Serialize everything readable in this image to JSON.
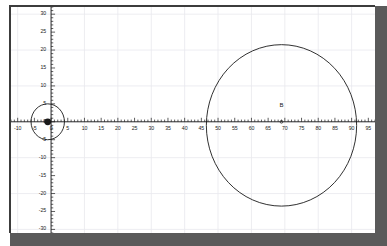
{
  "figure": {
    "background": "#ffffff",
    "frame_color": "#5a5a5a",
    "axis_color": "#1a1a1a",
    "grid_color": "#e9e9ee",
    "curve_color": "#1a1a1a"
  },
  "chart_data": {
    "type": "scatter",
    "title": "",
    "subtitle": "",
    "xlabel": "",
    "ylabel": "",
    "xlim": [
      -12,
      97
    ],
    "ylim": [
      -31,
      32
    ],
    "grid": true,
    "grid_step_x": 10,
    "grid_step_y": 10,
    "legend": "none",
    "x_major_step": 5,
    "x_minor_step": 1,
    "y_major_step": 5,
    "y_minor_step": 1,
    "x_ticks": [
      -10,
      -5,
      0,
      5,
      10,
      15,
      20,
      25,
      30,
      35,
      40,
      45,
      50,
      55,
      60,
      65,
      70,
      75,
      80,
      85,
      90,
      95
    ],
    "x_tick_labels": [
      "-10",
      "-5",
      "0",
      "5",
      "10",
      "15",
      "20",
      "25",
      "30",
      "35",
      "40",
      "45",
      "50",
      "55",
      "60",
      "65",
      "70",
      "75",
      "80",
      "85",
      "90",
      "95"
    ],
    "y_ticks": [
      30,
      25,
      20,
      15,
      10,
      5,
      0,
      -5,
      -10,
      -15,
      -20,
      -25,
      -30
    ],
    "y_tick_labels": [
      "30",
      "25",
      "20",
      "15",
      "10",
      "5",
      "0",
      "-5",
      "-10",
      "-15",
      "-20",
      "-25",
      "-30"
    ],
    "shapes": [
      {
        "kind": "circle",
        "name": "small-circle",
        "cx": -1,
        "cy": 0,
        "r": 5,
        "stroke": "#1a1a1a",
        "fill": "none"
      },
      {
        "kind": "circle",
        "name": "large-circle",
        "cx": 69,
        "cy": -1,
        "r": 22.5,
        "stroke": "#1a1a1a",
        "fill": "none"
      }
    ],
    "points": [
      {
        "name": "point-a",
        "label": "",
        "x": -1,
        "y": 0,
        "marker": "filled-dot",
        "size": 3.4
      },
      {
        "name": "point-b",
        "label": "B",
        "x": 69,
        "y": 0,
        "marker": "tick",
        "size": 1.4
      }
    ],
    "annotations": [
      {
        "name": "label-b",
        "text": "B",
        "x": 69,
        "y": 4.5
      }
    ]
  }
}
